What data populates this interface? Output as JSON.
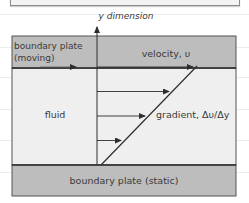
{
  "diagram": {
    "axis_label": "y dimension",
    "moving_plate_label_line1": "boundary plate",
    "moving_plate_label_line2": "(moving)",
    "velocity_label": "velocity, υ",
    "fluid_label": "fluid",
    "gradient_label": "gradient, Δυ/Δy",
    "static_plate_label": "boundary plate (static)",
    "velocity_profile": [
      1.0,
      0.75,
      0.5,
      0.25
    ],
    "colors": {
      "plate_fill": "#bdbdbd",
      "fluid_fill": "#efefef",
      "line": "#2e2e2e",
      "rule_lines": "#ececec"
    }
  }
}
